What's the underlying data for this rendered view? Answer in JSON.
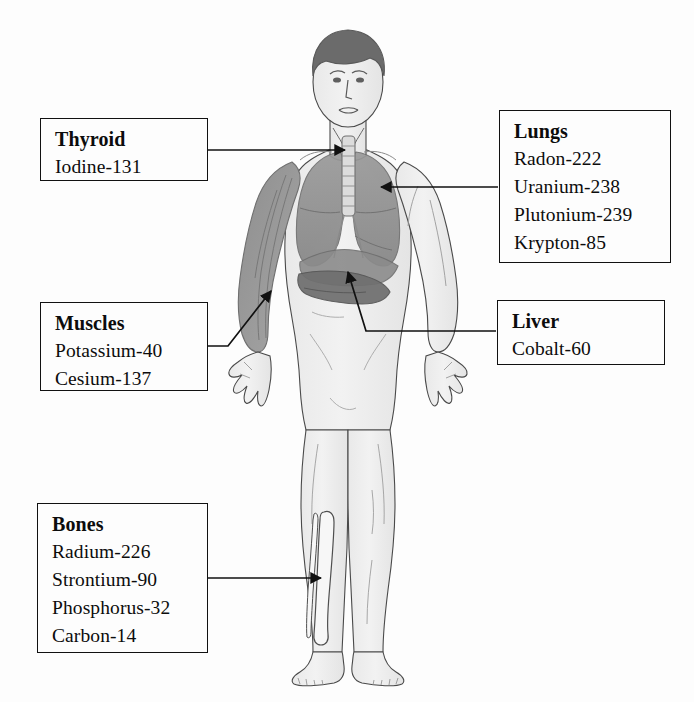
{
  "diagram": {
    "background_color": "#fdfdfd",
    "ink_color": "#111111"
  },
  "callouts": [
    {
      "id": "thyroid",
      "organ": "Thyroid",
      "isotopes": [
        "Iodine-131"
      ],
      "target_label": "neck-thyroid"
    },
    {
      "id": "lungs",
      "organ": "Lungs",
      "isotopes": [
        "Radon-222",
        "Uranium-238",
        "Plutonium-239",
        "Krypton-85"
      ],
      "target_label": "right-lung"
    },
    {
      "id": "muscles",
      "organ": "Muscles",
      "isotopes": [
        "Potassium-40",
        "Cesium-137"
      ],
      "target_label": "forearm-muscle"
    },
    {
      "id": "liver",
      "organ": "Liver",
      "isotopes": [
        "Cobalt-60"
      ],
      "target_label": "liver"
    },
    {
      "id": "bones",
      "organ": "Bones",
      "isotopes": [
        "Radium-226",
        "Strontium-90",
        "Phosphorus-32",
        "Carbon-14"
      ],
      "target_label": "tibia"
    }
  ],
  "figure": {
    "name": "anatomical-male-figure",
    "pose": "standing-frontal-arms-abducted",
    "rendering": "grayscale-line-illustration",
    "visible_structures": [
      "head",
      "face",
      "neck",
      "trachea",
      "spine",
      "left-arm-musculature",
      "right-arm",
      "hands",
      "lungs",
      "liver",
      "diaphragm",
      "torso",
      "legs",
      "tibia",
      "fibula",
      "feet"
    ]
  }
}
